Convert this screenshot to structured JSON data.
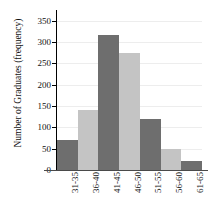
{
  "chart_data": {
    "type": "bar",
    "title": "",
    "subtitle": "",
    "xlabel": "",
    "ylabel": "Number of Graduates (frequency)",
    "categories": [
      "31-35",
      "36-40",
      "41-45",
      "46-50",
      "51-55",
      "56-60",
      "61-65"
    ],
    "values": [
      70,
      140,
      317,
      274,
      120,
      50,
      20
    ],
    "series": [
      {
        "name": "Number of Graduates (frequency)",
        "values": [
          70,
          140,
          317,
          274,
          120,
          50,
          20
        ]
      }
    ],
    "ylim": [
      0,
      375
    ],
    "yticks": [
      0,
      50,
      100,
      150,
      200,
      250,
      300,
      350
    ],
    "ytick_labels": [
      "0",
      "50",
      "100",
      "150",
      "200",
      "250",
      "300",
      "350"
    ],
    "grid": true,
    "grid_axis": "y",
    "legend": false,
    "legend_position": "none",
    "bar_colors": [
      "#6e6e6e",
      "#c4c4c4",
      "#6e6e6e",
      "#c4c4c4",
      "#6e6e6e",
      "#c4c4c4",
      "#6e6e6e"
    ],
    "bar_gap": 0,
    "annotations": []
  },
  "colors": {
    "dark_bar": "#6e6e6e",
    "light_bar": "#c4c4c4",
    "gridline": "#ededed",
    "axis": "#000000",
    "baseline": "#4a4a4a",
    "text": "#111111",
    "background": "#ffffff"
  }
}
